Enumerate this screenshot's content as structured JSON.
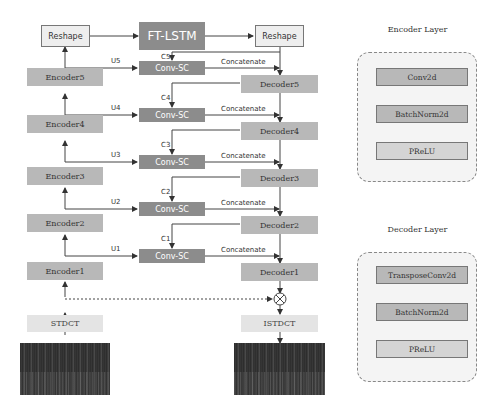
{
  "main": {
    "reshape_left": "Reshape",
    "ft_lstm": "FT-LSTM",
    "reshape_right": "Reshape",
    "encoders": [
      "Encoder5",
      "Encoder4",
      "Encoder3",
      "Encoder2",
      "Encoder1"
    ],
    "decoders": [
      "Decoder5",
      "Decoder4",
      "Decoder3",
      "Decoder2",
      "Decoder1"
    ],
    "conv_sc": [
      "Conv-SC",
      "Conv-SC",
      "Conv-SC",
      "Conv-SC",
      "Conv-SC"
    ],
    "u_labels": [
      "U5",
      "U4",
      "U3",
      "U2",
      "U1"
    ],
    "c_labels": [
      "C5",
      "C4",
      "C3",
      "C2",
      "C1"
    ],
    "concat_label": "Concatenate",
    "stdct": "STDCT",
    "istdct": "ISTDCT",
    "multiply_symbol": "⊗"
  },
  "encoder_layer": {
    "title": "Encoder Layer",
    "blocks": [
      "Conv2d",
      "BatchNorm2d",
      "PReLU"
    ]
  },
  "decoder_layer": {
    "title": "Decoder Layer",
    "blocks": [
      "TransposeConv2d",
      "BatchNorm2d",
      "PReLU"
    ]
  },
  "colors": {
    "light_box": "#eeeeee",
    "mid_box": "#b8b8b8",
    "dark_box": "#8c8c8c",
    "panel_bg": "#f4f4f4"
  }
}
